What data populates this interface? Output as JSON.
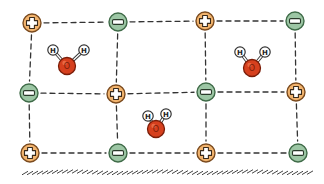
{
  "diagram": {
    "colors": {
      "cation_fill": "#f2b46e",
      "cation_stroke": "#7a4a1e",
      "anion_fill": "#9cc6a4",
      "anion_stroke": "#3f6b48",
      "oxygen_fill": "#d6401e",
      "oxygen_stroke": "#7a1d08",
      "hydrogen_fill": "#ffffff",
      "hydrogen_stroke": "#333333",
      "bond_color": "#333333",
      "grid_line": "#333333",
      "ground": "#444444"
    },
    "ions": [
      {
        "type": "cation",
        "symbol": "+",
        "x": 32,
        "y": 23
      },
      {
        "type": "anion",
        "symbol": "-",
        "x": 118,
        "y": 22
      },
      {
        "type": "cation",
        "symbol": "+",
        "x": 205,
        "y": 21
      },
      {
        "type": "anion",
        "symbol": "-",
        "x": 295,
        "y": 21
      },
      {
        "type": "anion",
        "symbol": "-",
        "x": 29,
        "y": 93
      },
      {
        "type": "cation",
        "symbol": "+",
        "x": 116,
        "y": 94
      },
      {
        "type": "anion",
        "symbol": "-",
        "x": 206,
        "y": 92
      },
      {
        "type": "cation",
        "symbol": "+",
        "x": 296,
        "y": 92
      },
      {
        "type": "cation",
        "symbol": "+",
        "x": 30,
        "y": 153
      },
      {
        "type": "anion",
        "symbol": "-",
        "x": 118,
        "y": 153
      },
      {
        "type": "cation",
        "symbol": "+",
        "x": 206,
        "y": 153
      },
      {
        "type": "anion",
        "symbol": "-",
        "x": 298,
        "y": 153
      }
    ],
    "water_molecules": [
      {
        "label_o": "O",
        "label_h": "H",
        "o": [
          67,
          66
        ],
        "h1": [
          53,
          50
        ],
        "h2": [
          84,
          50
        ]
      },
      {
        "label_o": "O",
        "label_h": "H",
        "o": [
          252,
          68
        ],
        "h1": [
          240,
          52
        ],
        "h2": [
          265,
          52
        ]
      },
      {
        "label_o": "O",
        "label_h": "H",
        "o": [
          156,
          129
        ],
        "h1": [
          148,
          116
        ],
        "h2": [
          166,
          114
        ]
      }
    ],
    "grid": {
      "rows": [
        [
          0,
          1,
          2,
          3
        ],
        [
          4,
          5,
          6,
          7
        ],
        [
          8,
          9,
          10,
          11
        ]
      ],
      "cols": [
        [
          0,
          4,
          8
        ],
        [
          1,
          5,
          9
        ],
        [
          2,
          6,
          10
        ],
        [
          3,
          7,
          11
        ]
      ]
    },
    "ground": {
      "x1": 22,
      "x2": 312,
      "y": 172
    }
  }
}
